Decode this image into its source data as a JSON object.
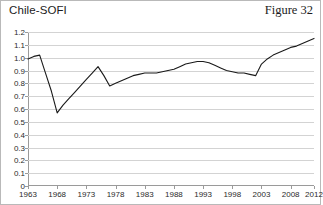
{
  "header": {
    "title": "Chile-SOFI",
    "figure_caption": "Figure 32"
  },
  "chart_data": {
    "type": "line",
    "title": "Chile-SOFI",
    "subtitle": "Figure 32",
    "xlabel": "",
    "ylabel": "",
    "xlim": [
      1963,
      2012
    ],
    "ylim": [
      0,
      1.2
    ],
    "grid": true,
    "legend": false,
    "line_color": "#1a1a1a",
    "grid_color": "#d3d3d3",
    "axis_color": "#9a9a9a",
    "ytick_labels": [
      "1.2",
      "1.1",
      "1.0",
      "0.9",
      "0.8",
      "0.7",
      "0.6",
      "0.5",
      "0.4",
      "0.3",
      "0.2",
      "0.1",
      "0"
    ],
    "ytick_values": [
      1.2,
      1.1,
      1.0,
      0.9,
      0.8,
      0.7,
      0.6,
      0.5,
      0.4,
      0.3,
      0.2,
      0.1,
      0
    ],
    "xtick_labels": [
      "1963",
      "1968",
      "1973",
      "1978",
      "1983",
      "1988",
      "1993",
      "1998",
      "2003",
      "2008",
      "2012"
    ],
    "xtick_values": [
      1963,
      1968,
      1973,
      1978,
      1983,
      1988,
      1993,
      1998,
      2003,
      2008,
      2012
    ],
    "series": [
      {
        "name": "Chile-SOFI",
        "x": [
          1963,
          1964,
          1965,
          1966,
          1967,
          1968,
          1969,
          1970,
          1971,
          1972,
          1973,
          1974,
          1975,
          1976,
          1977,
          1978,
          1979,
          1980,
          1981,
          1982,
          1983,
          1984,
          1985,
          1986,
          1987,
          1988,
          1989,
          1990,
          1991,
          1992,
          1993,
          1994,
          1995,
          1996,
          1997,
          1998,
          1999,
          2000,
          2001,
          2002,
          2003,
          2004,
          2005,
          2006,
          2007,
          2008,
          2009,
          2010,
          2011,
          2012
        ],
        "values": [
          0.99,
          1.01,
          1.02,
          0.88,
          0.74,
          0.57,
          0.63,
          0.68,
          0.73,
          0.78,
          0.83,
          0.88,
          0.93,
          0.86,
          0.78,
          0.8,
          0.82,
          0.84,
          0.86,
          0.87,
          0.88,
          0.88,
          0.88,
          0.89,
          0.9,
          0.91,
          0.93,
          0.95,
          0.96,
          0.97,
          0.97,
          0.96,
          0.94,
          0.92,
          0.9,
          0.89,
          0.88,
          0.88,
          0.87,
          0.86,
          0.95,
          0.99,
          1.02,
          1.04,
          1.06,
          1.08,
          1.09,
          1.11,
          1.13,
          1.15
        ]
      }
    ]
  }
}
